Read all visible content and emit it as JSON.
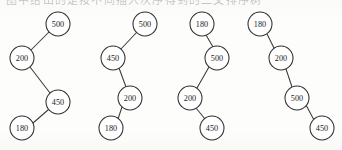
{
  "figure": {
    "type": "binary-search-tree-diagram-set",
    "caption_fragment": "图中给出的是按不同插入次序得到的二叉排序树",
    "background_color": "#fdfdfc",
    "node_stroke_color": "#2f2f2f",
    "node_fill_color": "#ffffff",
    "edge_color": "#3a3a3a",
    "node_radius": 12,
    "keys": [
      "180",
      "200",
      "450",
      "500"
    ],
    "trees": [
      {
        "name": "tree-1",
        "root_label": "500",
        "nodes": [
          {
            "label": "500",
            "cx": 58,
            "cy": 24
          },
          {
            "label": "200",
            "cx": 22,
            "cy": 58
          },
          {
            "label": "450",
            "cx": 58,
            "cy": 102
          },
          {
            "label": "180",
            "cx": 22,
            "cy": 128
          }
        ],
        "edges": [
          {
            "from": "500",
            "to": "200",
            "x1": 49,
            "y1": 32,
            "x2": 31,
            "y2": 50
          },
          {
            "from": "200",
            "to": "450",
            "x1": 30,
            "y1": 67,
            "x2": 50,
            "y2": 93
          },
          {
            "from": "450",
            "to": "180",
            "x1": 48,
            "y1": 110,
            "x2": 33,
            "y2": 123
          }
        ]
      },
      {
        "name": "tree-2",
        "root_label": "500",
        "nodes": [
          {
            "label": "500",
            "cx": 145,
            "cy": 24
          },
          {
            "label": "450",
            "cx": 113,
            "cy": 58
          },
          {
            "label": "200",
            "cx": 130,
            "cy": 98
          },
          {
            "label": "180",
            "cx": 111,
            "cy": 128
          }
        ],
        "edges": [
          {
            "from": "500",
            "to": "450",
            "x1": 137,
            "y1": 32,
            "x2": 121,
            "y2": 49
          },
          {
            "from": "450",
            "to": "200",
            "x1": 119,
            "y1": 68,
            "x2": 126,
            "y2": 87
          },
          {
            "from": "200",
            "to": "180",
            "x1": 122,
            "y1": 107,
            "x2": 118,
            "y2": 119
          }
        ]
      },
      {
        "name": "tree-3",
        "root_label": "180",
        "nodes": [
          {
            "label": "180",
            "cx": 202,
            "cy": 24
          },
          {
            "label": "500",
            "cx": 217,
            "cy": 58
          },
          {
            "label": "200",
            "cx": 190,
            "cy": 98
          },
          {
            "label": "450",
            "cx": 212,
            "cy": 128
          }
        ],
        "edges": [
          {
            "from": "180",
            "to": "500",
            "x1": 206,
            "y1": 35,
            "x2": 213,
            "y2": 47
          },
          {
            "from": "500",
            "to": "200",
            "x1": 209,
            "y1": 67,
            "x2": 197,
            "y2": 88
          },
          {
            "from": "200",
            "to": "450",
            "x1": 196,
            "y1": 108,
            "x2": 205,
            "y2": 119
          }
        ]
      },
      {
        "name": "tree-4",
        "root_label": "180",
        "nodes": [
          {
            "label": "180",
            "cx": 260,
            "cy": 24
          },
          {
            "label": "200",
            "cx": 281,
            "cy": 58
          },
          {
            "label": "500",
            "cx": 297,
            "cy": 98
          },
          {
            "label": "450",
            "cx": 322,
            "cy": 128
          }
        ],
        "edges": [
          {
            "from": "180",
            "to": "200",
            "x1": 267,
            "y1": 34,
            "x2": 274,
            "y2": 48
          },
          {
            "from": "200",
            "to": "500",
            "x1": 286,
            "y1": 69,
            "x2": 292,
            "y2": 87
          },
          {
            "from": "500",
            "to": "450",
            "x1": 306,
            "y1": 105,
            "x2": 314,
            "y2": 120
          }
        ]
      }
    ]
  }
}
